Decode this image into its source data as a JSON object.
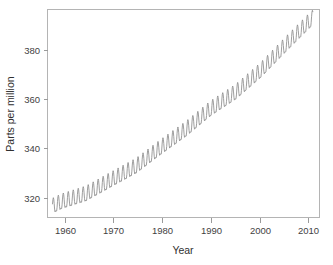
{
  "figure": {
    "background": "#ffffff",
    "line_color": "#8c8c8c",
    "axis_color": "#b4b4b4",
    "text_color": "#3f3f3f",
    "width": 333,
    "height": 265
  },
  "chart_data": {
    "type": "line",
    "title": "",
    "xlabel": "Year",
    "ylabel": "Parts per million",
    "xlim": [
      1957.2,
      2011.8
    ],
    "ylim": [
      311.0,
      394.5
    ],
    "xticks": [
      1960,
      1970,
      1980,
      1990,
      2000,
      2010
    ],
    "xtick_labels": [
      "1960",
      "1970",
      "1980",
      "1990",
      "2000",
      "2010"
    ],
    "yticks": [
      320,
      340,
      360,
      380
    ],
    "ytick_labels": [
      "320",
      "340",
      "360",
      "380"
    ],
    "grid": false,
    "legend": null,
    "legend_position": "none",
    "series": [
      {
        "name": "Atmospheric CO2 concentration (Mauna Loa monthly mean)",
        "color": "#8c8c8c",
        "x_start": 1958.208,
        "x_step": 0.08333333,
        "n_points": 628,
        "description": "Monthly mean CO2 in parts per million: smooth rising trend plus annual seasonal cycle of roughly +/- 3 ppm peaking in May and troughing in September/October.",
        "trend_anchors": [
          {
            "year": 1958.2,
            "ppm": 315.0
          },
          {
            "year": 1960.0,
            "ppm": 316.8
          },
          {
            "year": 1965.0,
            "ppm": 320.0
          },
          {
            "year": 1970.0,
            "ppm": 325.6
          },
          {
            "year": 1975.0,
            "ppm": 331.1
          },
          {
            "year": 1980.0,
            "ppm": 338.7
          },
          {
            "year": 1985.0,
            "ppm": 345.9
          },
          {
            "year": 1990.0,
            "ppm": 354.2
          },
          {
            "year": 1995.0,
            "ppm": 360.8
          },
          {
            "year": 2000.0,
            "ppm": 369.5
          },
          {
            "year": 2005.0,
            "ppm": 379.8
          },
          {
            "year": 2010.0,
            "ppm": 389.8
          },
          {
            "year": 2010.5,
            "ppm": 390.6
          }
        ],
        "seasonal_amplitude_ppm": 3.1,
        "seasonal_peak_month_fraction": 0.37,
        "y_min_observed": 312.9,
        "y_max_observed": 393.4
      }
    ]
  },
  "axes": {
    "year_label": "Year",
    "ppm_label": "Parts per million"
  }
}
